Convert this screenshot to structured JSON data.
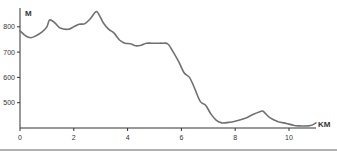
{
  "chart_data": {
    "type": "line",
    "title": "",
    "xlabel": "KM",
    "ylabel": "M",
    "xlim": [
      0,
      11
    ],
    "ylim": [
      400,
      880
    ],
    "x_ticks": [
      0,
      2,
      4,
      6,
      8,
      10
    ],
    "y_ticks": [
      500,
      600,
      700,
      800
    ],
    "grid": false,
    "legend": null,
    "series": [
      {
        "name": "Elevation",
        "color": "#707070",
        "x": [
          0,
          0.2,
          0.4,
          0.6,
          0.8,
          1.0,
          1.1,
          1.3,
          1.5,
          1.8,
          2.0,
          2.2,
          2.4,
          2.6,
          2.8,
          2.9,
          3.1,
          3.3,
          3.5,
          3.7,
          3.9,
          4.1,
          4.3,
          4.5,
          4.7,
          4.9,
          5.1,
          5.3,
          5.5,
          5.7,
          5.9,
          6.1,
          6.3,
          6.5,
          6.7,
          6.9,
          7.1,
          7.3,
          7.5,
          7.8,
          8.1,
          8.4,
          8.7,
          9.0,
          9.1,
          9.3,
          9.6,
          9.9,
          10.2,
          10.5,
          10.8,
          11.0
        ],
        "y": [
          784,
          765,
          757,
          765,
          778,
          800,
          827,
          815,
          795,
          790,
          800,
          810,
          812,
          830,
          858,
          855,
          815,
          790,
          775,
          748,
          735,
          733,
          725,
          727,
          735,
          735,
          735,
          735,
          732,
          700,
          662,
          618,
          600,
          555,
          505,
          490,
          455,
          430,
          420,
          423,
          430,
          440,
          455,
          467,
          460,
          440,
          425,
          418,
          410,
          408,
          410,
          420
        ]
      }
    ]
  },
  "axes": {
    "y_unit": "M",
    "x_unit": "KM",
    "x_tick_labels": [
      "0",
      "2",
      "4",
      "6",
      "8",
      "10"
    ],
    "y_tick_labels": [
      "800",
      "700",
      "600",
      "500"
    ]
  },
  "colors": {
    "line": "#707070",
    "axis": "#333333",
    "rule": "#999999"
  }
}
